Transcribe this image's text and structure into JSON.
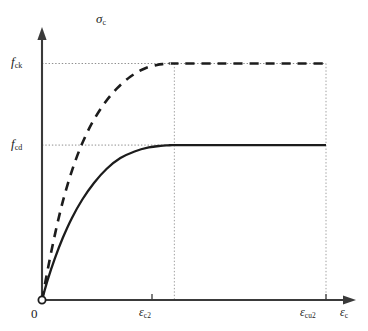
{
  "figure": {
    "origin_label": "0"
  },
  "axes": {
    "y_title_sym": "σ",
    "y_title_sub": "c",
    "x_title_sym": "ε",
    "x_title_sub": "c"
  },
  "ticks": {
    "y": [
      {
        "sym": "f",
        "sub": "ck"
      },
      {
        "sym": "f",
        "sub": "cd"
      }
    ],
    "x": [
      {
        "sym": "ε",
        "sub": "c2"
      },
      {
        "sym": "ε",
        "sub": "cu2"
      }
    ]
  },
  "chart_data": {
    "type": "line",
    "title": "",
    "xlabel": "εc",
    "ylabel": "σc",
    "grid": false,
    "legend": "none",
    "xlim": [
      0,
      1.18
    ],
    "ylim": [
      0,
      1.18
    ],
    "x_tick_labels": [
      "0",
      "εc2",
      "εcu2"
    ],
    "x_tick_values": [
      0,
      0.466,
      1.0
    ],
    "y_tick_labels": [
      "fcd",
      "fck"
    ],
    "y_tick_values": [
      0.655,
      1.0
    ],
    "annotations": [
      "dotted horizontal guide at fck",
      "dotted horizontal guide at fcd",
      "dotted vertical guide at εc2",
      "dotted vertical guide at εcu2",
      "open circle marker at origin"
    ],
    "series": [
      {
        "name": "characteristic-curve",
        "style": "dashed",
        "color": "#1c1c1c",
        "plateau_value": 1.0,
        "x": [
          0.0,
          0.022,
          0.047,
          0.074,
          0.105,
          0.139,
          0.177,
          0.219,
          0.264,
          0.312,
          0.36,
          0.405,
          0.43,
          0.45,
          0.466,
          0.62,
          0.78,
          0.9,
          1.0
        ],
        "y": [
          0.0,
          0.14,
          0.285,
          0.42,
          0.545,
          0.655,
          0.75,
          0.83,
          0.895,
          0.945,
          0.978,
          0.994,
          0.998,
          1.0,
          1.0,
          1.0,
          1.0,
          1.0,
          1.0
        ]
      },
      {
        "name": "design-curve",
        "style": "solid",
        "color": "#1c1c1c",
        "plateau_value": 0.655,
        "x": [
          0.0,
          0.02,
          0.045,
          0.073,
          0.105,
          0.142,
          0.183,
          0.228,
          0.276,
          0.326,
          0.376,
          0.418,
          0.444,
          0.458,
          0.466,
          0.62,
          0.78,
          0.9,
          1.0
        ],
        "y": [
          0.0,
          0.085,
          0.175,
          0.262,
          0.346,
          0.425,
          0.495,
          0.555,
          0.6,
          0.628,
          0.645,
          0.652,
          0.654,
          0.655,
          0.655,
          0.655,
          0.655,
          0.655,
          0.655
        ]
      }
    ]
  },
  "colors": {
    "ink": "#1c1c1c",
    "guide": "#9a9a9a",
    "background": "#ffffff"
  }
}
